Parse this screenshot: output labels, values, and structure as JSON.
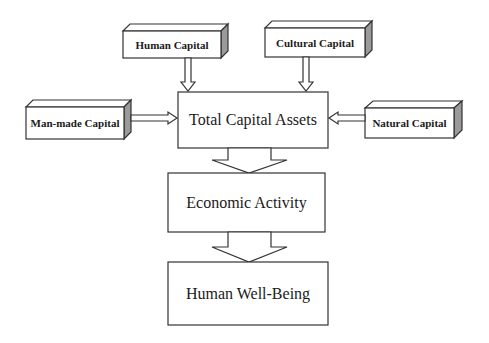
{
  "diagram": {
    "type": "flowchart",
    "inputs": [
      {
        "id": "human-capital",
        "label": "Human Capital",
        "position": "top-left"
      },
      {
        "id": "cultural-capital",
        "label": "Cultural Capital",
        "position": "top-right"
      },
      {
        "id": "man-made-capital",
        "label": "Man-made Capital",
        "position": "left"
      },
      {
        "id": "natural-capital",
        "label": "Natural Capital",
        "position": "right"
      }
    ],
    "stages": [
      {
        "id": "total-capital-assets",
        "label": "Total Capital Assets"
      },
      {
        "id": "economic-activity",
        "label": "Economic Activity"
      },
      {
        "id": "human-well-being",
        "label": "Human Well-Being"
      }
    ],
    "edges": [
      {
        "from": "human-capital",
        "to": "total-capital-assets"
      },
      {
        "from": "cultural-capital",
        "to": "total-capital-assets"
      },
      {
        "from": "man-made-capital",
        "to": "total-capital-assets"
      },
      {
        "from": "natural-capital",
        "to": "total-capital-assets"
      },
      {
        "from": "total-capital-assets",
        "to": "economic-activity"
      },
      {
        "from": "economic-activity",
        "to": "human-well-being"
      }
    ],
    "colors": {
      "stroke": "#333333",
      "side_face": "#9a9a9a",
      "background": "#ffffff"
    }
  }
}
